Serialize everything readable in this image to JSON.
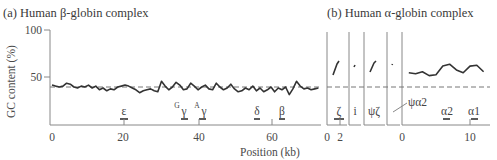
{
  "panel_a": {
    "title": "(a) Human β-globin complex",
    "ylabel": "GC content (%)",
    "xlabel": "Position (kb)",
    "yticks": [
      "100",
      "50"
    ],
    "xticks": [
      "0",
      "20",
      "40",
      "60"
    ],
    "genes": [
      {
        "label": "ε",
        "sup": "",
        "pos": 20
      },
      {
        "label": "γ",
        "sup": "G",
        "pos": 36
      },
      {
        "label": "γ",
        "sup": "A",
        "pos": 41
      },
      {
        "label": "δ",
        "sup": "",
        "pos": 56
      },
      {
        "label": "β",
        "sup": "",
        "pos": 62
      }
    ]
  },
  "panel_b": {
    "title": "(b) Human α-globin complex",
    "xticks_left": [
      "0",
      "2"
    ],
    "xticks_right": [
      "0",
      "10"
    ],
    "genes": [
      {
        "label": "ζ",
        "pos": "2"
      },
      {
        "label": "i",
        "pos": ""
      },
      {
        "label": "ψζ",
        "pos": ""
      },
      {
        "label": "ψα2",
        "pos": ""
      },
      {
        "label": "α2",
        "pos": 7
      },
      {
        "label": "α1",
        "pos": 10.5
      }
    ]
  },
  "chart_data": [
    {
      "type": "line",
      "title": "(a) Human β-globin complex",
      "xlabel": "Position (kb)",
      "ylabel": "GC content (%)",
      "xlim": [
        0,
        75
      ],
      "ylim": [
        0,
        100
      ],
      "xticks": [
        0,
        20,
        40,
        60
      ],
      "yticks": [
        50,
        100
      ],
      "reference_line": {
        "y": 40,
        "style": "dashed"
      },
      "series": [
        {
          "name": "GC content",
          "x": [
            0,
            1,
            2,
            3,
            4,
            5,
            6,
            7,
            8,
            9,
            10,
            11,
            12,
            13,
            14,
            15,
            16,
            17,
            18,
            19,
            20,
            21,
            22,
            23,
            24,
            25,
            26,
            27,
            28,
            29,
            30,
            31,
            32,
            33,
            34,
            35,
            36,
            37,
            38,
            39,
            40,
            41,
            42,
            43,
            44,
            45,
            46,
            47,
            48,
            49,
            50,
            51,
            52,
            53,
            54,
            55,
            56,
            57,
            58,
            59,
            60,
            61,
            62,
            63,
            64,
            65,
            66,
            67,
            68,
            69,
            70,
            71,
            72,
            73
          ],
          "values": [
            42,
            41,
            40,
            41,
            44,
            43,
            40,
            39,
            41,
            40,
            42,
            39,
            41,
            37,
            39,
            36,
            38,
            37,
            40,
            41,
            42,
            41,
            39,
            37,
            34,
            36,
            37,
            38,
            36,
            35,
            46,
            41,
            37,
            40,
            45,
            42,
            37,
            38,
            44,
            41,
            37,
            40,
            42,
            38,
            37,
            44,
            40,
            37,
            39,
            43,
            38,
            35,
            36,
            39,
            37,
            41,
            36,
            39,
            35,
            37,
            40,
            35,
            39,
            37,
            40,
            32,
            38,
            46,
            41,
            38,
            39,
            37,
            38,
            39
          ]
        }
      ],
      "annotations": [
        "ε @20kb",
        "Gγ @36kb",
        "Aγ @41kb",
        "δ @56kb",
        "β @62kb"
      ]
    },
    {
      "type": "line",
      "title": "(b) Human α-globin complex",
      "xlabel": "Position (kb)",
      "ylabel": "GC content (%)",
      "xlim": [
        0,
        12
      ],
      "ylim": [
        0,
        100
      ],
      "xticks": [
        0,
        10
      ],
      "reference_line": {
        "y": 40,
        "style": "dashed"
      },
      "series": [
        {
          "name": "GC content",
          "x": [
            1,
            2,
            3,
            4,
            5,
            6,
            7,
            8,
            9,
            10,
            11,
            12
          ],
          "values": [
            55,
            54,
            56,
            52,
            53,
            62,
            64,
            58,
            55,
            62,
            63,
            56
          ]
        }
      ],
      "segments": [
        {
          "label": "ζ",
          "values": [
            54,
            62
          ]
        },
        {
          "label": "i",
          "values": [
            62
          ]
        },
        {
          "label": "ψζ",
          "values": [
            56,
            64
          ]
        },
        {
          "label": "ψα2",
          "values": [
            60
          ]
        }
      ],
      "annotations": [
        "ζ @2kb",
        "i",
        "ψζ",
        "ψα2",
        "α2 @~7kb",
        "α1 @~10.5kb"
      ]
    }
  ]
}
